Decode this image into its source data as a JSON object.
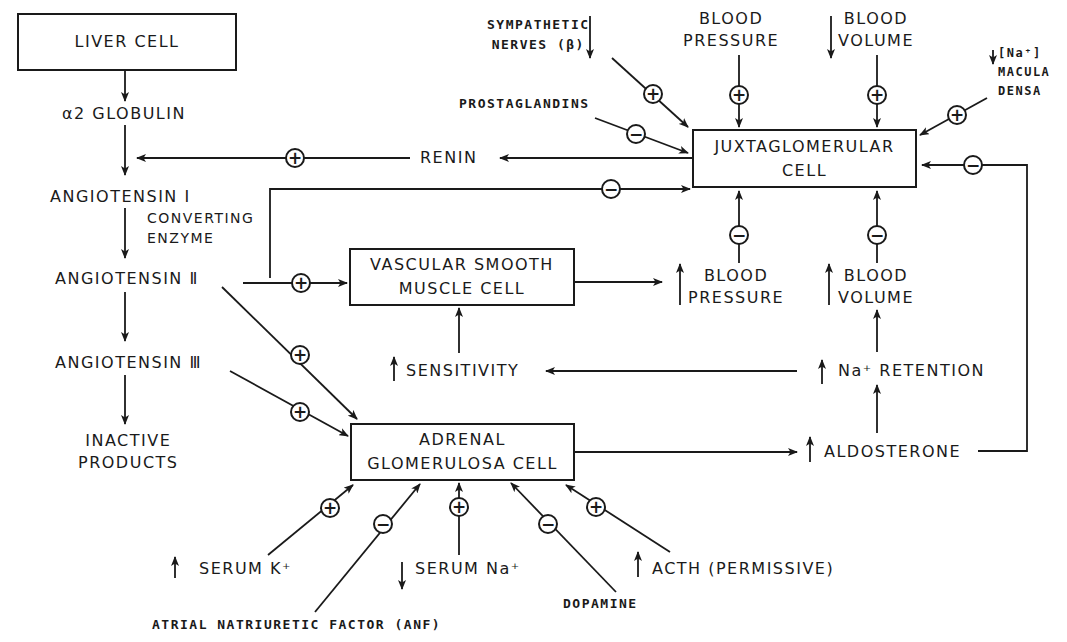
{
  "diagram": {
    "boxes": {
      "liver": "LIVER CELL",
      "jg_line1": "JUXTAGLOMERULAR",
      "jg_line2": "CELL",
      "vsm_line1": "VASCULAR SMOOTH",
      "vsm_line2": "MUSCLE CELL",
      "adrenal_line1": "ADRENAL",
      "adrenal_line2": "GLOMERULOSA CELL"
    },
    "cascade": {
      "globulin": "α2 GLOBULIN",
      "ang1": "ANGIOTENSIN Ⅰ",
      "converting_line1": "CONVERTING",
      "converting_line2": "ENZYME",
      "ang2": "ANGIOTENSIN Ⅱ",
      "ang3": "ANGIOTENSIN Ⅲ",
      "inactive_line1": "INACTIVE",
      "inactive_line2": "PRODUCTS"
    },
    "jg_inputs": {
      "sympathetic_line1": "SYMPATHETIC",
      "sympathetic_line2": "NERVES (β)",
      "prostaglandins": "PROSTAGLANDINS",
      "low_bp_line1": "BLOOD",
      "low_bp_line2": "PRESSURE",
      "low_bv_line1": "BLOOD",
      "low_bv_line2": "VOLUME",
      "macula_line1": "[Na⁺]",
      "macula_line2": "MACULA",
      "macula_line3": "DENSA",
      "renin": "RENIN"
    },
    "effects": {
      "high_bp_line1": "BLOOD",
      "high_bp_line2": "PRESSURE",
      "high_bv_line1": "BLOOD",
      "high_bv_line2": "VOLUME",
      "sensitivity": "SENSITIVITY",
      "na_retention": "Na⁺ RETENTION",
      "aldosterone": "ALDOSTERONE"
    },
    "adrenal_inputs": {
      "serum_k": "SERUM K⁺",
      "anf": "ATRIAL NATRIURETIC FACTOR (ANF)",
      "serum_na": "SERUM Na⁺",
      "dopamine": "DOPAMINE",
      "acth": "ACTH (PERMISSIVE)"
    },
    "symbols": {
      "plus": "+",
      "minus": "−",
      "up_arrow": "↑",
      "down_arrow": "↓"
    }
  }
}
